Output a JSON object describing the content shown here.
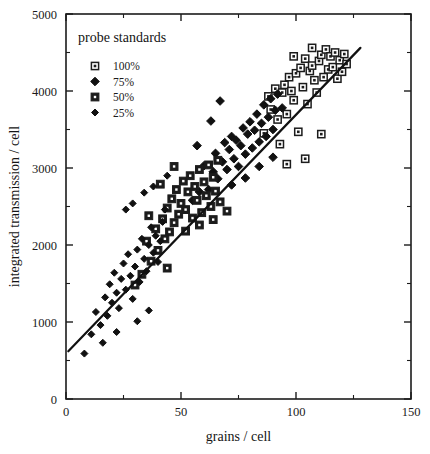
{
  "chart_data": {
    "type": "scatter",
    "title": "",
    "xlabel": "grains / cell",
    "ylabel": "integrated transmission / cell",
    "xlim": [
      0,
      150
    ],
    "ylim": [
      0,
      5000
    ],
    "xticks": [
      0,
      50,
      100,
      150
    ],
    "yticks": [
      0,
      1000,
      2000,
      3000,
      4000,
      5000
    ],
    "xtick_labels": [
      "0",
      "50",
      "100",
      "150"
    ],
    "ytick_labels": [
      "0",
      "1000",
      "2000",
      "3000",
      "4000",
      "5000"
    ],
    "x_minor_step": 25,
    "y_minor_step": 500,
    "grid": false,
    "legend_position": "upper-left-inside",
    "legend_title": "probe standards",
    "series": [
      {
        "name": "100%",
        "marker": "open-square",
        "points": [
          [
            86,
            3450
          ],
          [
            88,
            3930
          ],
          [
            89,
            3760
          ],
          [
            91,
            4030
          ],
          [
            92,
            3630
          ],
          [
            93,
            3310
          ],
          [
            94,
            3980
          ],
          [
            95,
            4080
          ],
          [
            96,
            3700
          ],
          [
            97,
            4180
          ],
          [
            98,
            4000
          ],
          [
            99,
            3880
          ],
          [
            100,
            4230
          ],
          [
            101,
            3470
          ],
          [
            102,
            4300
          ],
          [
            103,
            4050
          ],
          [
            104,
            4420
          ],
          [
            105,
            3830
          ],
          [
            106,
            4260
          ],
          [
            107,
            4330
          ],
          [
            108,
            4140
          ],
          [
            109,
            3980
          ],
          [
            110,
            4390
          ],
          [
            111,
            4470
          ],
          [
            112,
            4180
          ],
          [
            113,
            4540
          ],
          [
            114,
            4280
          ],
          [
            115,
            4450
          ],
          [
            116,
            4310
          ],
          [
            117,
            4500
          ],
          [
            118,
            4160
          ],
          [
            119,
            4400
          ],
          [
            120,
            4250
          ],
          [
            121,
            4480
          ],
          [
            122,
            4350
          ],
          [
            104,
            3120
          ],
          [
            111,
            3440
          ],
          [
            96,
            3050
          ],
          [
            99,
            4450
          ],
          [
            107,
            4560
          ]
        ]
      },
      {
        "name": "75%",
        "marker": "diamond",
        "points": [
          [
            55,
            2580
          ],
          [
            58,
            2690
          ],
          [
            60,
            3030
          ],
          [
            62,
            2720
          ],
          [
            64,
            2950
          ],
          [
            65,
            3190
          ],
          [
            66,
            2860
          ],
          [
            68,
            3080
          ],
          [
            69,
            3330
          ],
          [
            70,
            2980
          ],
          [
            71,
            3240
          ],
          [
            72,
            3410
          ],
          [
            73,
            3120
          ],
          [
            74,
            3360
          ],
          [
            75,
            3020
          ],
          [
            76,
            3290
          ],
          [
            77,
            3520
          ],
          [
            78,
            3180
          ],
          [
            79,
            3440
          ],
          [
            80,
            3600
          ],
          [
            81,
            3260
          ],
          [
            82,
            3490
          ],
          [
            83,
            3700
          ],
          [
            84,
            3340
          ],
          [
            85,
            3580
          ],
          [
            86,
            3820
          ],
          [
            87,
            3410
          ],
          [
            88,
            3660
          ],
          [
            89,
            3900
          ],
          [
            90,
            3500
          ],
          [
            91,
            3750
          ],
          [
            92,
            3960
          ],
          [
            63,
            3610
          ],
          [
            67,
            3870
          ],
          [
            57,
            3290
          ],
          [
            72,
            2780
          ],
          [
            78,
            2870
          ],
          [
            84,
            3020
          ],
          [
            90,
            3140
          ],
          [
            94,
            3780
          ]
        ]
      },
      {
        "name": "50%",
        "marker": "solid-square",
        "points": [
          [
            30,
            1480
          ],
          [
            33,
            1620
          ],
          [
            35,
            2050
          ],
          [
            37,
            1790
          ],
          [
            39,
            2210
          ],
          [
            40,
            1930
          ],
          [
            42,
            2340
          ],
          [
            43,
            2080
          ],
          [
            44,
            2480
          ],
          [
            45,
            2170
          ],
          [
            46,
            2600
          ],
          [
            47,
            2290
          ],
          [
            48,
            2720
          ],
          [
            49,
            2400
          ],
          [
            50,
            2540
          ],
          [
            51,
            2830
          ],
          [
            52,
            2460
          ],
          [
            53,
            2690
          ],
          [
            54,
            2900
          ],
          [
            55,
            2350
          ],
          [
            56,
            2760
          ],
          [
            57,
            2580
          ],
          [
            58,
            2980
          ],
          [
            59,
            2420
          ],
          [
            60,
            2820
          ],
          [
            61,
            2640
          ],
          [
            62,
            3040
          ],
          [
            63,
            2500
          ],
          [
            64,
            2880
          ],
          [
            65,
            2700
          ],
          [
            66,
            3100
          ],
          [
            67,
            2560
          ],
          [
            41,
            2790
          ],
          [
            47,
            3020
          ],
          [
            36,
            2380
          ],
          [
            52,
            2180
          ],
          [
            58,
            2260
          ],
          [
            64,
            2330
          ],
          [
            70,
            2440
          ],
          [
            44,
            1700
          ]
        ]
      },
      {
        "name": "25%",
        "marker": "diamond-small",
        "points": [
          [
            8,
            590
          ],
          [
            11,
            840
          ],
          [
            13,
            1130
          ],
          [
            15,
            960
          ],
          [
            17,
            1320
          ],
          [
            18,
            1080
          ],
          [
            19,
            1490
          ],
          [
            20,
            1250
          ],
          [
            21,
            1640
          ],
          [
            22,
            1380
          ],
          [
            23,
            1180
          ],
          [
            24,
            1560
          ],
          [
            25,
            1760
          ],
          [
            26,
            1420
          ],
          [
            27,
            1880
          ],
          [
            28,
            1600
          ],
          [
            29,
            1300
          ],
          [
            30,
            1720
          ],
          [
            31,
            1940
          ],
          [
            32,
            1520
          ],
          [
            33,
            2080
          ],
          [
            34,
            1820
          ],
          [
            35,
            1660
          ],
          [
            36,
            2000
          ],
          [
            37,
            2230
          ],
          [
            38,
            1900
          ],
          [
            39,
            2120
          ],
          [
            40,
            1780
          ],
          [
            41,
            2050
          ],
          [
            42,
            2300
          ],
          [
            26,
            2460
          ],
          [
            29,
            2540
          ],
          [
            34,
            2680
          ],
          [
            38,
            2760
          ],
          [
            44,
            2900
          ],
          [
            16,
            730
          ],
          [
            22,
            870
          ],
          [
            31,
            1010
          ],
          [
            36,
            1150
          ],
          [
            43,
            2460
          ]
        ]
      }
    ],
    "fit_line": {
      "label": "linear fit",
      "x0": 1,
      "y0": 620,
      "x1": 128,
      "y1": 4560
    }
  }
}
